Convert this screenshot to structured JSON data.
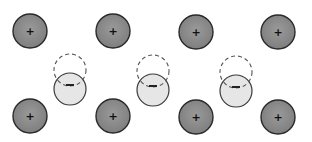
{
  "diagram": {
    "colors": {
      "background": "#ffffff",
      "positive_ion_fill": "#8a8a8a",
      "positive_ion_stroke": "#2a2a2a",
      "negative_cloud_fill": "#e6e6e6",
      "negative_cloud_stroke": "#3a3a3a",
      "dashed_outline_stroke": "#555555"
    },
    "positive_ions": [
      {
        "cx": 30,
        "cy": 31,
        "r": 17,
        "label": "+"
      },
      {
        "cx": 113,
        "cy": 31,
        "r": 17,
        "label": "+"
      },
      {
        "cx": 196,
        "cy": 32,
        "r": 17,
        "label": "+"
      },
      {
        "cx": 278,
        "cy": 32,
        "r": 17,
        "label": "+"
      },
      {
        "cx": 30,
        "cy": 116,
        "r": 17,
        "label": "+"
      },
      {
        "cx": 113,
        "cy": 116,
        "r": 17,
        "label": "+"
      },
      {
        "cx": 196,
        "cy": 117,
        "r": 17,
        "label": "+"
      },
      {
        "cx": 278,
        "cy": 117,
        "r": 17,
        "label": "+"
      }
    ],
    "displaced_charges": [
      {
        "original": {
          "cx": 70,
          "cy": 70,
          "r": 16
        },
        "shifted": {
          "cx": 70,
          "cy": 89,
          "r": 16
        },
        "label": "−"
      },
      {
        "original": {
          "cx": 153,
          "cy": 71,
          "r": 16
        },
        "shifted": {
          "cx": 153,
          "cy": 90,
          "r": 16
        },
        "label": "−"
      },
      {
        "original": {
          "cx": 236,
          "cy": 72,
          "r": 16
        },
        "shifted": {
          "cx": 236,
          "cy": 91,
          "r": 16
        },
        "label": "−"
      }
    ]
  }
}
